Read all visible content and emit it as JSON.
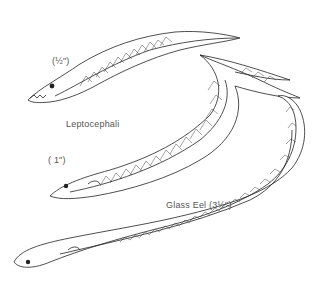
{
  "figure": {
    "labels": {
      "half_inch": "(½\")",
      "leptocephali": "Leptocephali",
      "one_inch": "( 1\")",
      "glass_eel": "Glass Eel (3½\")"
    },
    "colors": {
      "background": "#ffffff",
      "line": "#222222",
      "label_text": "#555555"
    }
  }
}
